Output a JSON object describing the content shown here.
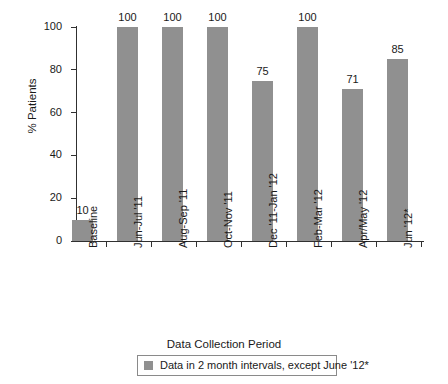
{
  "chart_data": {
    "type": "bar",
    "title": "",
    "categories": [
      "Baseline",
      "Jun-Jul '11",
      "Aug-Sep '11",
      "Oct-Nov '11",
      "Dec '11-Jan '12",
      "Feb-Mar '12",
      "Apr/May '12",
      "Jun '12*"
    ],
    "values": [
      10,
      100,
      100,
      100,
      75,
      100,
      71,
      85
    ],
    "value_labels": [
      "10",
      "100",
      "100",
      "100",
      "75",
      "100",
      "71",
      "85"
    ],
    "xlabel": "Data Collection Period",
    "ylabel": "% Patients",
    "ylim": [
      0,
      100
    ],
    "yticks": [
      0,
      20,
      40,
      60,
      80,
      100
    ],
    "ytick_labels": [
      "0",
      "20",
      "40",
      "60",
      "80",
      "100"
    ],
    "grid": false,
    "legend_position": "bottom",
    "legend": [
      {
        "label": "Data in 2 month intervals, except June '12*",
        "color": "#909090"
      }
    ],
    "series": [
      {
        "name": "Data in 2 month intervals, except June '12*",
        "color": "#909090",
        "values": [
          10,
          100,
          100,
          100,
          75,
          100,
          71,
          85
        ]
      }
    ],
    "colors": {
      "bar": "#909090",
      "axis": "#303030",
      "text": "#1a1a1a",
      "background": "#ffffff",
      "legend_border": "#8a8a8a"
    }
  }
}
